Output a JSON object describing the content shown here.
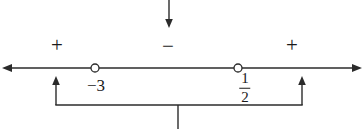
{
  "figure": {
    "type": "sign-chart-number-line",
    "title": "",
    "background_color": "#ffffff",
    "stroke_color": "#2b2b2b",
    "text_color": "#1a1a1a",
    "width": 364,
    "height": 129
  },
  "number_line": {
    "y": 68,
    "x_start": 2,
    "x_end": 362,
    "left_arrow": true,
    "right_arrow": true
  },
  "critical_points": [
    {
      "label": "−3",
      "value": -3,
      "x": 95,
      "marker": "open-circle",
      "included": false,
      "label_x": 96,
      "label_y": 85
    },
    {
      "label": "1/2",
      "numerator": "1",
      "denominator": "2",
      "value": 0.5,
      "x": 238,
      "marker": "open-circle",
      "included": false,
      "label_x": 245,
      "label_y": 88
    }
  ],
  "sign_regions": [
    {
      "name": "left-region",
      "sign": "+",
      "interval": "(-∞, -3)",
      "label_x": 57,
      "label_y": 45
    },
    {
      "name": "middle-region",
      "sign": "−",
      "interval": "(-3, 1/2)",
      "label_x": 168,
      "label_y": 46
    },
    {
      "name": "right-region",
      "sign": "+",
      "interval": "(1/2, ∞)",
      "label_x": 292,
      "label_y": 45
    }
  ],
  "annotations": {
    "top_pointer": {
      "name": "middle-region-pointer",
      "direction": "down",
      "x": 169,
      "y_start": 0,
      "y_end": 28
    },
    "bottom_bracket": {
      "name": "outer-regions-bracket",
      "left_x": 56,
      "right_x": 302,
      "arrow_tip_y": 76,
      "rail_y": 105,
      "stem_x": 178,
      "stem_y_end": 129,
      "direction": "up"
    }
  }
}
